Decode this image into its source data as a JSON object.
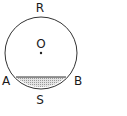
{
  "diagram": {
    "circle": {
      "center_label": "O",
      "cx": 41,
      "cy": 53,
      "r": 36
    },
    "points": [
      {
        "label": "R",
        "x": 40,
        "y": 12
      },
      {
        "label": "A",
        "x": 5,
        "y": 85
      },
      {
        "label": "B",
        "x": 78,
        "y": 85
      },
      {
        "label": "S",
        "x": 40,
        "y": 104
      }
    ],
    "chord": {
      "from": "A",
      "to": "B"
    },
    "shaded_region": "minor segment ASB",
    "colors": {
      "stroke": "#333333",
      "shade": "#bdbdbd"
    }
  }
}
